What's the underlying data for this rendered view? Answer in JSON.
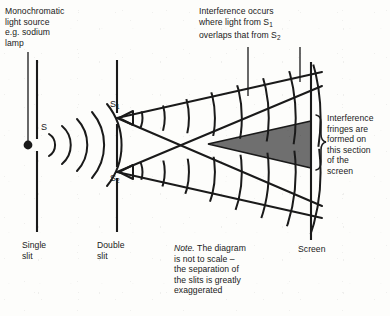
{
  "diagram": {
    "colors": {
      "ink": "#1a1a1a",
      "shade": "#6f6f6f",
      "background": "#fdfdfb"
    }
  },
  "labels": {
    "source": "Monochromatic\nlight source\ne.g. sodium\nlamp",
    "source_lines": [
      "Monochromatic",
      "light source",
      "e.g. sodium",
      "lamp"
    ],
    "interference": "Interference occurs\nwhere light from S1\noverlaps that from S2",
    "interference_lines": [
      "Interference occurs",
      "where light from S",
      "overlaps that from S"
    ],
    "interference_sub_1": "1",
    "interference_sub_2": "2",
    "fringes_lines": [
      "Interference",
      "fringes are",
      "formed on",
      "this section",
      "of the",
      "screen"
    ],
    "note_italic": "Note.",
    "note_lines": [
      " The diagram",
      "is not to scale –",
      "the separation of",
      "the slits is greatly",
      "exaggerated"
    ],
    "single_slit_lines": [
      "Single",
      "slit"
    ],
    "double_slit_lines": [
      "Double",
      "slit"
    ],
    "screen": "Screen",
    "s": "S",
    "s1": "S",
    "s1_sub": "1",
    "s2": "S",
    "s2_sub": "2"
  },
  "geometry": {
    "single_slit_x": 37,
    "double_slit_x": 117,
    "screen_x": 311,
    "source_dot": {
      "x": 28,
      "y": 145
    },
    "slit1_y": 118,
    "slit2_y": 172,
    "shade_apex": {
      "x": 208,
      "y": 144
    },
    "brace": {
      "x": 318,
      "y_top": 115,
      "y_bottom": 179
    }
  }
}
